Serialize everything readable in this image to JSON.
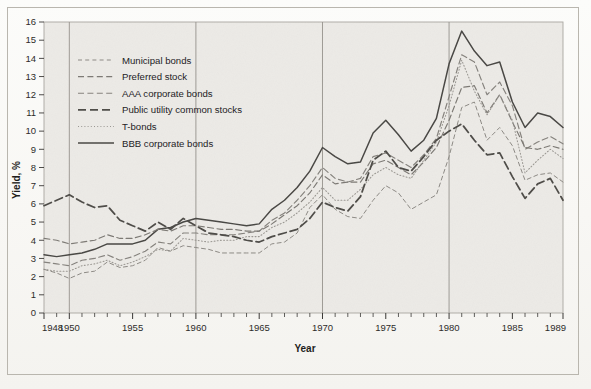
{
  "figure": {
    "kind": "scanned-line-chart",
    "background_color": "#f7f6f3",
    "plot_fill": "#e9e8e4",
    "frame_color": "#b9b6ae"
  },
  "axes": {
    "x_title": "Year",
    "y_title": "Yield, %",
    "x_tick_labels": [
      "1948",
      "1950",
      "1955",
      "1960",
      "1965",
      "1970",
      "1975",
      "1980",
      "1985",
      "1989"
    ],
    "y_tick_labels": [
      "0",
      "1",
      "2",
      "3",
      "4",
      "5",
      "6",
      "7",
      "8",
      "9",
      "10",
      "11",
      "12",
      "13",
      "14",
      "15",
      "16"
    ],
    "vertical_reference_years": [
      1950,
      1960,
      1970,
      1980
    ]
  },
  "legend": {
    "entries": [
      {
        "label": "Municipal bonds",
        "style": "fine-dash",
        "color": "#8d8a85"
      },
      {
        "label": "Preferred stock",
        "style": "dash",
        "color": "#7d7a75"
      },
      {
        "label": "AAA corporate bonds",
        "style": "dash",
        "color": "#86837e"
      },
      {
        "label": "Public utility common stocks",
        "style": "bold-dash",
        "color": "#4f4d49"
      },
      {
        "label": "T-bonds",
        "style": "dotted",
        "color": "#9a9792"
      },
      {
        "label": "BBB corporate bonds",
        "style": "solid",
        "color": "#4a4845"
      }
    ]
  },
  "chart_data": {
    "type": "line",
    "title": "",
    "xlabel": "Year",
    "ylabel": "Yield, %",
    "xlim": [
      1948,
      1989
    ],
    "ylim": [
      0,
      16
    ],
    "grid": false,
    "legend_position": "upper-left-inside",
    "x": [
      1948,
      1949,
      1950,
      1951,
      1952,
      1953,
      1954,
      1955,
      1956,
      1957,
      1958,
      1959,
      1960,
      1961,
      1962,
      1963,
      1964,
      1965,
      1966,
      1967,
      1968,
      1969,
      1970,
      1971,
      1972,
      1973,
      1974,
      1975,
      1976,
      1977,
      1978,
      1979,
      1980,
      1981,
      1982,
      1983,
      1984,
      1985,
      1986,
      1987,
      1988,
      1989
    ],
    "series": [
      {
        "name": "BBB corporate bonds",
        "style": "solid",
        "color": "#4a4845",
        "values": [
          3.2,
          3.1,
          3.2,
          3.3,
          3.5,
          3.8,
          3.8,
          3.8,
          4.0,
          4.6,
          4.7,
          5.0,
          5.2,
          5.1,
          5.0,
          4.9,
          4.8,
          4.9,
          5.7,
          6.2,
          6.9,
          7.8,
          9.1,
          8.6,
          8.2,
          8.3,
          9.9,
          10.6,
          9.8,
          8.9,
          9.5,
          10.7,
          13.7,
          15.5,
          14.4,
          13.6,
          13.8,
          11.6,
          10.2,
          11.0,
          10.8,
          10.2
        ]
      },
      {
        "name": "AAA corporate bonds",
        "style": "dash",
        "color": "#86837e",
        "values": [
          2.8,
          2.7,
          2.6,
          2.9,
          3.0,
          3.2,
          2.9,
          3.1,
          3.4,
          3.9,
          3.8,
          4.4,
          4.4,
          4.3,
          4.3,
          4.3,
          4.4,
          4.5,
          5.1,
          5.5,
          6.2,
          7.0,
          8.0,
          7.4,
          7.2,
          7.4,
          8.6,
          8.8,
          8.4,
          8.0,
          8.7,
          9.6,
          11.9,
          14.2,
          13.8,
          12.0,
          12.7,
          11.4,
          9.0,
          9.4,
          9.7,
          9.3
        ]
      },
      {
        "name": "Preferred stock",
        "style": "dash",
        "color": "#7d7a75",
        "values": [
          4.1,
          4.0,
          3.8,
          3.9,
          4.0,
          4.3,
          4.1,
          4.1,
          4.3,
          4.6,
          4.5,
          4.8,
          4.8,
          4.7,
          4.6,
          4.6,
          4.5,
          4.5,
          4.9,
          5.4,
          5.9,
          6.6,
          7.6,
          7.1,
          7.2,
          7.2,
          8.2,
          8.4,
          8.0,
          7.6,
          8.3,
          9.1,
          10.6,
          12.4,
          12.5,
          11.0,
          12.0,
          10.5,
          9.1,
          9.0,
          9.2,
          9.0
        ]
      },
      {
        "name": "T-bonds",
        "style": "dotted",
        "color": "#9a9792",
        "values": [
          2.4,
          2.3,
          2.3,
          2.6,
          2.7,
          2.9,
          2.6,
          2.8,
          3.1,
          3.5,
          3.4,
          4.1,
          4.0,
          3.9,
          4.0,
          4.0,
          4.2,
          4.2,
          4.7,
          5.0,
          5.5,
          6.1,
          6.9,
          6.2,
          6.2,
          6.8,
          7.6,
          8.0,
          7.6,
          7.4,
          8.4,
          9.4,
          11.4,
          13.9,
          12.2,
          10.9,
          12.0,
          10.6,
          7.7,
          8.4,
          9.0,
          8.5
        ]
      },
      {
        "name": "Municipal bonds",
        "style": "fine-dash",
        "color": "#8d8a85",
        "values": [
          2.4,
          2.2,
          1.9,
          2.2,
          2.3,
          2.8,
          2.5,
          2.6,
          2.9,
          3.6,
          3.4,
          3.7,
          3.6,
          3.5,
          3.3,
          3.3,
          3.3,
          3.3,
          3.8,
          3.9,
          4.4,
          5.8,
          6.5,
          5.7,
          5.3,
          5.2,
          6.2,
          7.0,
          6.6,
          5.7,
          6.1,
          6.5,
          8.6,
          11.3,
          11.6,
          9.5,
          10.2,
          9.2,
          7.3,
          7.6,
          7.7,
          7.2
        ]
      },
      {
        "name": "Public utility common stocks",
        "style": "bold-dash",
        "color": "#4f4d49",
        "values": [
          5.9,
          6.2,
          6.5,
          6.1,
          5.8,
          5.9,
          5.1,
          4.8,
          4.5,
          5.0,
          4.6,
          5.2,
          4.8,
          4.4,
          4.3,
          4.2,
          4.0,
          3.9,
          4.2,
          4.4,
          4.6,
          5.2,
          6.1,
          5.8,
          5.6,
          6.4,
          8.4,
          8.9,
          8.0,
          7.8,
          8.6,
          9.5,
          10.0,
          10.4,
          9.5,
          8.7,
          8.8,
          7.5,
          6.3,
          7.1,
          7.4,
          6.2
        ]
      }
    ]
  }
}
